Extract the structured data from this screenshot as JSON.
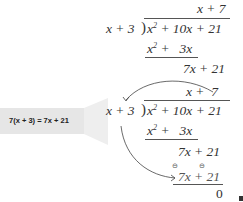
{
  "division_1": {
    "quotient": "x + 7",
    "divisor": "x + 3",
    "dividend": {
      "x": "x",
      "exp": "2",
      "rest": " + 10x + 21"
    },
    "subtract_line": {
      "x": "x",
      "exp": "2",
      "rest": " +   3x"
    },
    "remainder_line": "7x + 21"
  },
  "division_2": {
    "quotient": "x +  7",
    "divisor": "x + 3",
    "dividend": {
      "x": "x",
      "exp": "2",
      "rest": " + 10x + 21"
    },
    "subtract_line": {
      "x": "x",
      "exp": "2",
      "rest": " +   3x"
    },
    "remainder_line": "7x + 21",
    "subtract_line_2": "7x + 21",
    "sign_changes": [
      "⊖",
      "⊖"
    ],
    "final_remainder": "0"
  },
  "callout": {
    "text": "7(x + 3) = 7x + 21",
    "background": "#e6e6e6"
  },
  "colors": {
    "ink": "#333333",
    "callout_bg": "#e6e6e6"
  }
}
